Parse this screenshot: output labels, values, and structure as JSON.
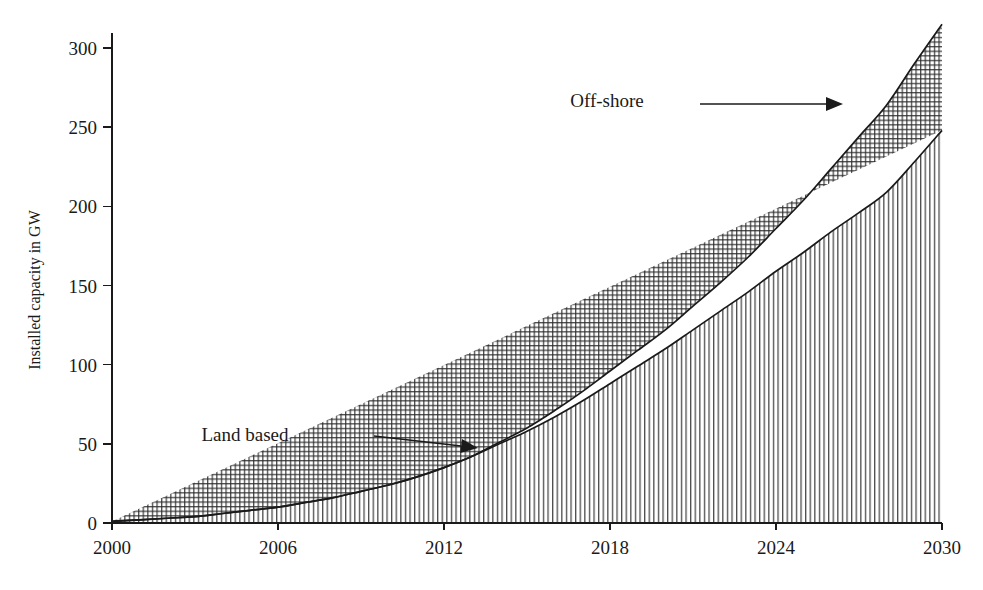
{
  "chart_data": {
    "type": "area",
    "title": "",
    "subtitle": "",
    "xlabel": "",
    "ylabel": "Installed capacity in GW",
    "xlim": [
      2000,
      2030
    ],
    "ylim": [
      0,
      300
    ],
    "grid": false,
    "legend_position": "inline-annotations",
    "x_tick_labels": [
      "2000",
      "2006",
      "2012",
      "2018",
      "2024",
      "2030"
    ],
    "x_ticks": [
      2000,
      2006,
      2012,
      2018,
      2024,
      2030
    ],
    "y_tick_labels": [
      "0",
      "50",
      "100",
      "150",
      "200",
      "250",
      "300"
    ],
    "y_ticks": [
      0,
      50,
      100,
      150,
      200,
      250,
      300
    ],
    "x": [
      2000,
      2001,
      2002,
      2003,
      2004,
      2005,
      2006,
      2007,
      2008,
      2009,
      2010,
      2011,
      2012,
      2013,
      2014,
      2015,
      2016,
      2017,
      2018,
      2019,
      2020,
      2021,
      2022,
      2023,
      2024,
      2025,
      2026,
      2027,
      2028,
      2029,
      2030
    ],
    "series": [
      {
        "name": "Land based",
        "fill_pattern": "vertical-lines",
        "values": [
          1,
          2,
          3,
          4,
          6,
          8,
          10,
          13,
          16,
          20,
          24,
          29,
          35,
          42,
          50,
          58,
          67,
          77,
          88,
          99,
          110,
          122,
          134,
          146,
          159,
          171,
          184,
          196,
          209,
          228,
          248
        ]
      },
      {
        "name": "Off-shore",
        "fill_pattern": "crosshatch",
        "values": [
          0,
          0,
          0,
          0,
          0,
          0,
          0,
          0,
          0,
          0,
          0,
          0,
          0,
          0,
          1,
          2,
          4,
          6,
          8,
          10,
          12,
          15,
          18,
          22,
          27,
          33,
          40,
          48,
          55,
          62,
          67
        ]
      }
    ],
    "totals": [
      1,
      2,
      3,
      4,
      6,
      8,
      10,
      13,
      16,
      20,
      24,
      29,
      35,
      42,
      51,
      60,
      71,
      83,
      96,
      109,
      122,
      137,
      152,
      168,
      186,
      204,
      224,
      244,
      264,
      290,
      315
    ],
    "annotations": [
      {
        "text": "Land based",
        "label_x": 245,
        "label_y": 441,
        "arrow_from_x": 374,
        "arrow_from_y": 436,
        "arrow_to_x": 478,
        "arrow_to_y": 448
      },
      {
        "text": "Off-shore",
        "label_x": 607,
        "label_y": 107,
        "arrow_from_x": 700,
        "arrow_from_y": 104,
        "arrow_to_x": 843,
        "arrow_to_y": 104
      }
    ]
  },
  "colors": {
    "background": "#ffffff",
    "ink": "#1a1a1a",
    "hatch": "#2a2a2a"
  }
}
